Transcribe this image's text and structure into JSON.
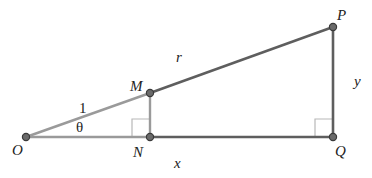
{
  "diagram": {
    "type": "geometry",
    "colors": {
      "light_line": "#9a9a9a",
      "dark_line": "#5a5a5a",
      "right_angle_mark": "#b0b0b0",
      "point_fill": "#6a6a6a",
      "point_stroke": "#3a3a3a",
      "label": "#222222"
    },
    "points": [
      {
        "id": "O",
        "label": "O",
        "x": 26,
        "y": 137
      },
      {
        "id": "N",
        "label": "N",
        "x": 150,
        "y": 137
      },
      {
        "id": "Q",
        "label": "Q",
        "x": 333,
        "y": 137
      },
      {
        "id": "M",
        "label": "M",
        "x": 150,
        "y": 93
      },
      {
        "id": "P",
        "label": "P",
        "x": 333,
        "y": 27
      }
    ],
    "segments": [
      {
        "from": "O",
        "to": "M",
        "style": "light",
        "label": "1"
      },
      {
        "from": "M",
        "to": "N",
        "style": "light",
        "label": ""
      },
      {
        "from": "O",
        "to": "N",
        "style": "light",
        "label": ""
      },
      {
        "from": "M",
        "to": "P",
        "style": "dark",
        "label": "r"
      },
      {
        "from": "P",
        "to": "Q",
        "style": "dark",
        "label": "y"
      },
      {
        "from": "N",
        "to": "Q",
        "style": "dark",
        "label": "x"
      }
    ],
    "right_angles": [
      "N",
      "Q"
    ],
    "angle_label": {
      "at": "O",
      "text": "θ"
    },
    "labels": {
      "O": "O",
      "N": "N",
      "Q": "Q",
      "M": "M",
      "P": "P",
      "one": "1",
      "theta": "θ",
      "r": "r",
      "x": "x",
      "y": "y"
    }
  }
}
